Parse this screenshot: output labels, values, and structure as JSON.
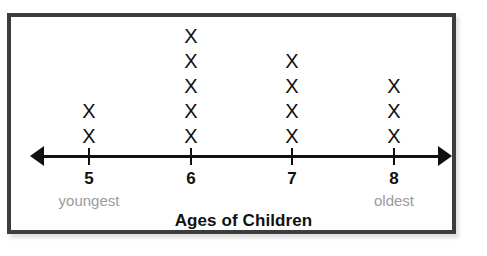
{
  "chart_data": {
    "type": "bar",
    "plot_style": "dot-plot",
    "title": "Ages of Children",
    "xlabel": "",
    "ylabel": "",
    "categories": [
      "5",
      "6",
      "7",
      "8"
    ],
    "values": [
      2,
      5,
      4,
      3
    ],
    "marker": "X",
    "grid": false,
    "legend": null,
    "axis": {
      "orientation": "horizontal",
      "arrow_left": true,
      "arrow_right": true,
      "tick_labels": [
        "5",
        "6",
        "7",
        "8"
      ]
    },
    "annotations": [
      {
        "text": "youngest",
        "at_category": "5",
        "color": "#9a9a9a"
      },
      {
        "text": "oldest",
        "at_category": "8",
        "color": "#9a9a9a"
      }
    ]
  },
  "figure": {
    "title": "Ages of Children",
    "frame_color": "#3d3d3d",
    "ink_color": "#111111",
    "note_color": "#9a9a9a",
    "background": "#ffffff",
    "columns": [
      {
        "label": "5",
        "count": 2,
        "marks": [
          "X",
          "X"
        ],
        "note": "youngest",
        "center_x": 89
      },
      {
        "label": "6",
        "count": 5,
        "marks": [
          "X",
          "X",
          "X",
          "X",
          "X"
        ],
        "note": "",
        "center_x": 191
      },
      {
        "label": "7",
        "count": 4,
        "marks": [
          "X",
          "X",
          "X",
          "X"
        ],
        "note": "",
        "center_x": 292
      },
      {
        "label": "8",
        "count": 3,
        "marks": [
          "X",
          "X",
          "X"
        ],
        "note": "oldest",
        "center_x": 394
      }
    ]
  }
}
